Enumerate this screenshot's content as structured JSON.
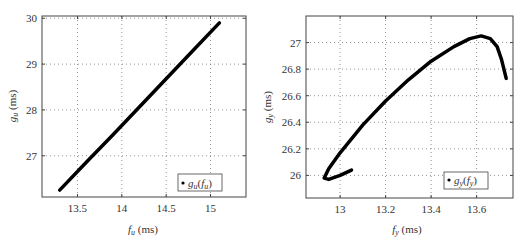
{
  "chart_data": [
    {
      "type": "line",
      "title": "",
      "xlabel": "f_u (ms)",
      "ylabel": "g_u (ms)",
      "xlabel_main": "f",
      "xlabel_sub": "u",
      "xlabel_unit": " (ms)",
      "ylabel_main": "g",
      "ylabel_sub": "u",
      "ylabel_unit": " (ms)",
      "xlim": [
        13.1,
        15.4
      ],
      "ylim": [
        26.1,
        30.05
      ],
      "xticks": [
        13.5,
        14,
        14.5,
        15
      ],
      "xtick_labels": [
        "13.5",
        "14",
        "14.5",
        "15"
      ],
      "yticks": [
        27,
        28,
        29,
        30
      ],
      "ytick_labels": [
        "27",
        "28",
        "29",
        "30"
      ],
      "grid": true,
      "legend": {
        "position": "lower right",
        "entries": [
          "g_u(f_u)"
        ],
        "main": "g",
        "sub": "u",
        "arg_main": "f",
        "arg_sub": "u"
      },
      "series": [
        {
          "name": "g_u(f_u)",
          "x": [
            13.3,
            13.6,
            13.9,
            14.2,
            14.5,
            14.8,
            15.1
          ],
          "y": [
            26.25,
            26.86,
            27.46,
            28.07,
            28.68,
            29.29,
            29.9
          ]
        }
      ]
    },
    {
      "type": "line",
      "title": "",
      "xlabel": "f_y (ms)",
      "ylabel": "g_y (ms)",
      "xlabel_main": "f",
      "xlabel_sub": "y",
      "xlabel_unit": " (ms)",
      "ylabel_main": "g",
      "ylabel_sub": "y",
      "ylabel_unit": " (ms)",
      "xlim": [
        12.85,
        13.76
      ],
      "ylim": [
        25.83,
        27.2
      ],
      "xticks": [
        13,
        13.2,
        13.4,
        13.6
      ],
      "xtick_labels": [
        "13",
        "13.2",
        "13.4",
        "13.6"
      ],
      "yticks": [
        26,
        26.2,
        26.4,
        26.6,
        26.8,
        27
      ],
      "ytick_labels": [
        "26",
        "26.2",
        "26.4",
        "26.6",
        "26.8",
        "27"
      ],
      "grid": true,
      "legend": {
        "position": "lower right",
        "entries": [
          "g_y(f_y)"
        ],
        "main": "g",
        "sub": "y",
        "arg_main": "f",
        "arg_sub": "y"
      },
      "series": [
        {
          "name": "g_y(f_y)",
          "x": [
            13.05,
            13.0,
            12.95,
            12.93,
            12.95,
            13.0,
            13.1,
            13.2,
            13.3,
            13.4,
            13.5,
            13.57,
            13.62,
            13.66,
            13.69,
            13.71,
            13.73
          ],
          "y": [
            26.04,
            26.0,
            25.97,
            25.98,
            26.05,
            26.17,
            26.38,
            26.56,
            26.72,
            26.86,
            26.97,
            27.03,
            27.05,
            27.03,
            26.97,
            26.87,
            26.73
          ]
        }
      ]
    }
  ]
}
